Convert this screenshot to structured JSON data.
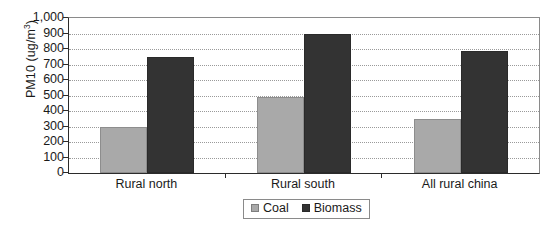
{
  "chart_data": {
    "type": "bar",
    "title": "",
    "xlabel": "",
    "ylabel": "PM10 (ug/m",
    "ylabel_sup": "3",
    "ylabel_tail": ")",
    "categories": [
      "Rural north",
      "Rural south",
      "All rural china"
    ],
    "series": [
      {
        "name": "Coal",
        "color": "#a9a9a9",
        "values": [
          300,
          490,
          350
        ]
      },
      {
        "name": "Biomass",
        "color": "#333333",
        "values": [
          750,
          900,
          790
        ]
      }
    ],
    "ylim": [
      0,
      1000
    ],
    "ytick_step": 100,
    "ytick_labels": [
      "1,000",
      "900",
      "800",
      "700",
      "600",
      "500",
      "400",
      "300",
      "200",
      "100",
      "0"
    ],
    "ytick_values": [
      1000,
      900,
      800,
      700,
      600,
      500,
      400,
      300,
      200,
      100,
      0
    ],
    "grid": true,
    "legend_position": "bottom-center"
  }
}
